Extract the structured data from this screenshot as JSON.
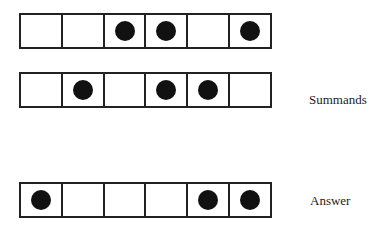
{
  "diagram": {
    "rows": [
      {
        "role": "summand",
        "cells": [
          0,
          0,
          1,
          1,
          0,
          1
        ]
      },
      {
        "role": "summand",
        "cells": [
          0,
          1,
          0,
          1,
          1,
          0
        ]
      },
      {
        "role": "answer",
        "cells": [
          1,
          0,
          0,
          0,
          1,
          1
        ]
      }
    ],
    "labels": {
      "summands": "Summands",
      "answer": "Answer"
    },
    "colors": {
      "line": "#222222",
      "dot": "#111111",
      "background": "#ffffff"
    }
  }
}
